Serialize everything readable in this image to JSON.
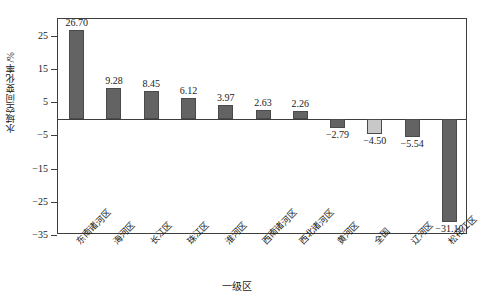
{
  "chart_data": {
    "type": "bar",
    "title": "",
    "xlabel": "一级区",
    "ylabel": "水域空间变化率/%",
    "ylim": [
      -35,
      30
    ],
    "yticks": [
      25,
      15,
      5,
      -5,
      -15,
      -25,
      -35
    ],
    "ytick_labels": [
      "25",
      "15",
      "5",
      "−5",
      "−15",
      "−25",
      "−35"
    ],
    "grid": false,
    "legend": "none",
    "categories": [
      "东南诸河区",
      "海河区",
      "长江区",
      "珠江区",
      "淮河区",
      "西南诸河区",
      "西北诸河区",
      "黄河区",
      "全国",
      "辽河区",
      "松花江区"
    ],
    "values": [
      26.7,
      9.28,
      8.45,
      6.12,
      3.97,
      2.63,
      2.26,
      -2.79,
      -4.5,
      -5.54,
      -31.1
    ],
    "value_labels": [
      "26.70",
      "9.28",
      "8.45",
      "6.12",
      "3.97",
      "2.63",
      "2.26",
      "−2.79",
      "−4.50",
      "−5.54",
      "−31.10"
    ],
    "bar_colors": [
      "#636363",
      "#636363",
      "#636363",
      "#636363",
      "#636363",
      "#636363",
      "#636363",
      "#636363",
      "#c8c8c8",
      "#636363",
      "#636363"
    ],
    "highlight_category": "全国",
    "highlight_color": "#c8c8c8",
    "series_color": "#636363",
    "axis_color": "#3d3d3d",
    "background": "#ffffff"
  }
}
